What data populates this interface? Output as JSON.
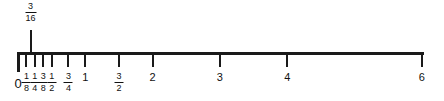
{
  "figure": {
    "line_color": "#1a1a1a",
    "background": "#ffffff"
  },
  "chart_data": {
    "type": "numberline",
    "title": "",
    "xlabel": "",
    "ylabel": "",
    "xlim": [
      0,
      6
    ],
    "grid": false,
    "legend": null,
    "axis": {
      "start_value": 0,
      "end_value": 6,
      "pixels_per_unit": 67.3,
      "origin_x": 17,
      "axis_y": 52
    },
    "ticks": [
      {
        "value": 0,
        "label": "0",
        "label_type": "integer",
        "direction": "down",
        "length": 20,
        "weight": "heavy"
      },
      {
        "value": 0.125,
        "label": "1/8",
        "label_type": "fraction",
        "numerator": "1",
        "denominator": "8",
        "direction": "down",
        "length": 15,
        "weight": "normal"
      },
      {
        "value": 0.25,
        "label": "1/4",
        "label_type": "fraction",
        "numerator": "1",
        "denominator": "4",
        "direction": "down",
        "length": 15,
        "weight": "normal"
      },
      {
        "value": 0.375,
        "label": "3/8",
        "label_type": "fraction",
        "numerator": "3",
        "denominator": "8",
        "direction": "down",
        "length": 15,
        "weight": "normal"
      },
      {
        "value": 0.5,
        "label": "1/2",
        "label_type": "fraction",
        "numerator": "1",
        "denominator": "2",
        "direction": "down",
        "length": 15,
        "weight": "normal"
      },
      {
        "value": 0.75,
        "label": "3/4",
        "label_type": "fraction",
        "numerator": "3",
        "denominator": "4",
        "direction": "down",
        "length": 15,
        "weight": "normal"
      },
      {
        "value": 1,
        "label": "1",
        "label_type": "integer",
        "direction": "down",
        "length": 15,
        "weight": "normal"
      },
      {
        "value": 1.5,
        "label": "3/2",
        "label_type": "fraction",
        "numerator": "3",
        "denominator": "2",
        "direction": "down",
        "length": 15,
        "weight": "normal"
      },
      {
        "value": 2,
        "label": "2",
        "label_type": "integer",
        "direction": "down",
        "length": 15,
        "weight": "normal"
      },
      {
        "value": 3,
        "label": "3",
        "label_type": "integer",
        "direction": "down",
        "length": 15,
        "weight": "normal"
      },
      {
        "value": 4,
        "label": "4",
        "label_type": "integer",
        "direction": "down",
        "length": 15,
        "weight": "normal"
      },
      {
        "value": 6,
        "label": "6",
        "label_type": "integer",
        "direction": "down",
        "length": 15,
        "weight": "normal"
      }
    ],
    "callout": {
      "value": 0.1875,
      "label": "3/16",
      "numerator": "3",
      "denominator": "16",
      "direction": "up",
      "length": 22
    }
  }
}
